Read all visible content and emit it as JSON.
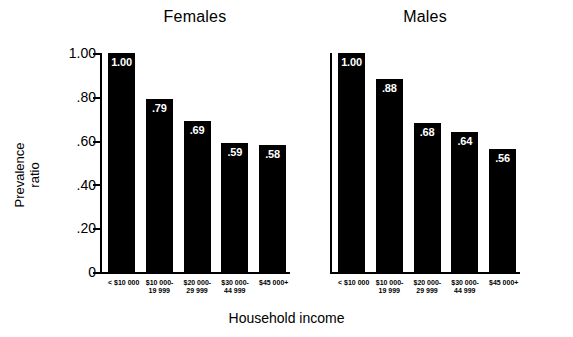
{
  "chart_data": {
    "type": "bar",
    "title": "",
    "xlabel": "Household income",
    "ylabel_line1": "Prevalence",
    "ylabel_line2": "ratio",
    "ylim": [
      0,
      1.0
    ],
    "yticks": [
      "1.00",
      ".80",
      ".60",
      ".40",
      ".20",
      "0"
    ],
    "ytick_values": [
      1.0,
      0.8,
      0.6,
      0.4,
      0.2,
      0
    ],
    "grid": false,
    "legend": "none",
    "categories": [
      {
        "line1": "< $10 000",
        "line2": ""
      },
      {
        "line1": "$10 000-",
        "line2": "19 999"
      },
      {
        "line1": "$20 000-",
        "line2": "29 999"
      },
      {
        "line1": "$30 000-",
        "line2": "44 999"
      },
      {
        "line1": "$45 000+",
        "line2": ""
      }
    ],
    "bar_color": "#000000",
    "value_label_color": "#ffffff",
    "panels": [
      {
        "name": "Females",
        "title": "Females",
        "values": [
          1.0,
          0.79,
          0.69,
          0.59,
          0.58
        ],
        "labels": [
          "1.00",
          ".79",
          ".69",
          ".59",
          ".58"
        ]
      },
      {
        "name": "Males",
        "title": "Males",
        "values": [
          1.0,
          0.88,
          0.68,
          0.64,
          0.56
        ],
        "labels": [
          "1.00",
          ".88",
          ".68",
          ".64",
          ".56"
        ]
      }
    ]
  }
}
